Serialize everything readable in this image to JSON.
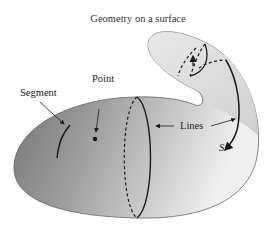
{
  "title": "Geometry on a surface",
  "labels": {
    "segment": "Segment",
    "point": "Point",
    "lines": "Lines",
    "s": "S"
  },
  "colors": {
    "surface_dark": "#6e6e6e",
    "surface_light": "#f2f2f2",
    "stroke": "#1a1a1a"
  }
}
